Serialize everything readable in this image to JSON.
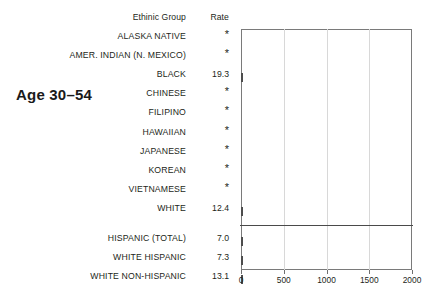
{
  "panel": {
    "age_label": "Age 30–54"
  },
  "table": {
    "headers": {
      "group": "Ethinic Group",
      "rate": "Rate"
    },
    "suppressed_marker": "*"
  },
  "chart_data": {
    "type": "bar",
    "orientation": "horizontal",
    "title": "Age 30–54",
    "xlabel": "",
    "ylabel": "Ethinic Group",
    "xlim": [
      0,
      2000
    ],
    "ticks": [
      0,
      500,
      1000,
      1500,
      2000
    ],
    "tick_labels": [
      "0",
      "500",
      "1000",
      "1500",
      "2000"
    ],
    "grid": "vertical-minor",
    "legend": "none",
    "bar_color": "#4d4d4d",
    "suppressed_marker": "*",
    "groups": [
      {
        "name": "primary",
        "categories": [
          "ALASKA NATIVE",
          "AMER. INDIAN (N. MEXICO)",
          "BLACK",
          "CHINESE",
          "FILIPINO",
          "HAWAIIAN",
          "JAPANESE",
          "KOREAN",
          "VIETNAMESE",
          "WHITE"
        ],
        "rate_labels": [
          "*",
          "*",
          "19.3",
          "*",
          "*",
          "*",
          "*",
          "*",
          "*",
          "12.4"
        ],
        "values": [
          null,
          null,
          19.3,
          null,
          null,
          null,
          null,
          null,
          null,
          12.4
        ]
      },
      {
        "name": "hispanic-breakout",
        "categories": [
          "HISPANIC (TOTAL)",
          "WHITE HISPANIC",
          "WHITE NON-HISPANIC"
        ],
        "rate_labels": [
          "7.0",
          "7.3",
          "13.1"
        ],
        "values": [
          7.0,
          7.3,
          13.1
        ]
      }
    ]
  }
}
